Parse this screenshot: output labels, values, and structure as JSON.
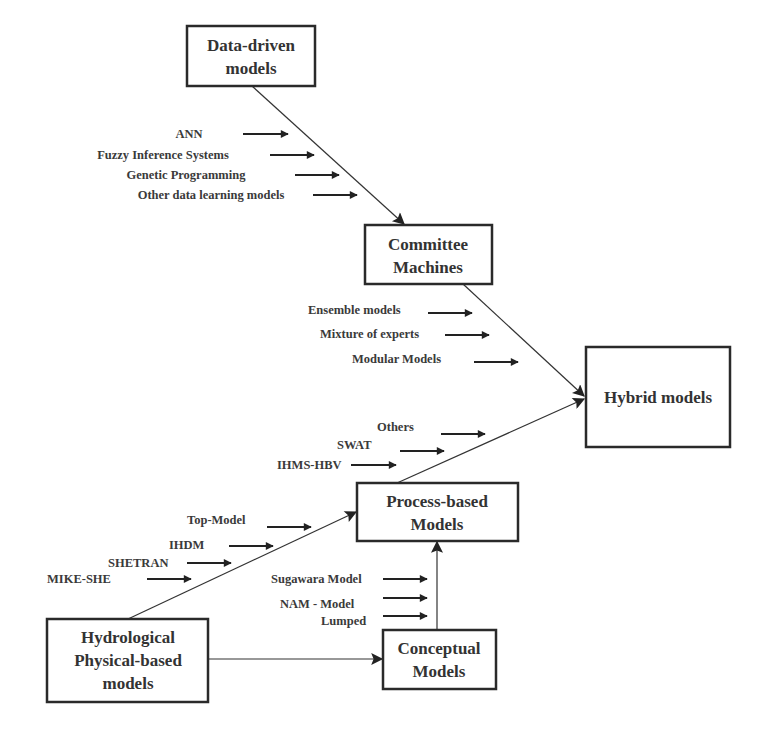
{
  "diagram": {
    "nodes": {
      "data_driven": {
        "line1": "Data-driven",
        "line2": "models"
      },
      "committee": {
        "line1": "Committee",
        "line2": "Machines"
      },
      "hybrid": {
        "label": "Hybrid models"
      },
      "process": {
        "line1": "Process-based",
        "line2": "Models"
      },
      "hydrological": {
        "line1": "Hydrological",
        "line2": "Physical-based",
        "line3": "models"
      },
      "conceptual": {
        "line1": "Conceptual",
        "line2": "Models"
      }
    },
    "data_driven_inputs": [
      "ANN",
      "Fuzzy Inference Systems",
      "Genetic Programming",
      "Other data learning models"
    ],
    "committee_inputs": [
      "Ensemble models",
      "Mixture of experts",
      "Modular Models"
    ],
    "process_to_hybrid_inputs": [
      "Others",
      "SWAT",
      "IHMS-HBV"
    ],
    "hydro_to_process_inputs": [
      "Top-Model",
      "IHDM",
      "SHETRAN",
      "MIKE-SHE"
    ],
    "conceptual_inputs": [
      "Sugawara Model",
      "NAM - Model",
      "Lumped"
    ],
    "edges": [
      {
        "from": "Data-driven models",
        "to": "Committee Machines"
      },
      {
        "from": "Committee Machines",
        "to": "Hybrid models"
      },
      {
        "from": "Process-based Models",
        "to": "Hybrid models"
      },
      {
        "from": "Hydrological Physical-based models",
        "to": "Process-based Models"
      },
      {
        "from": "Hydrological Physical-based models",
        "to": "Conceptual Models"
      },
      {
        "from": "Conceptual Models",
        "to": "Process-based Models"
      }
    ]
  }
}
